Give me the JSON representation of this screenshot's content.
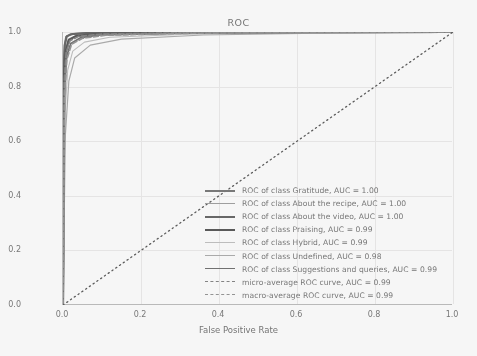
{
  "chart_data": {
    "type": "line",
    "title": "ROC",
    "xlabel": "False Positive Rate",
    "ylabel": "True Positive Rate",
    "xlim": [
      0.0,
      1.0
    ],
    "ylim": [
      0.0,
      1.0
    ],
    "grid": true,
    "legend_position": "lower right",
    "xticks": [
      "0.0",
      "0.2",
      "0.4",
      "0.6",
      "0.8",
      "1.0"
    ],
    "yticks": [
      "0.0",
      "0.2",
      "0.4",
      "0.6",
      "0.8",
      "1.0"
    ],
    "xtick_values": [
      0.0,
      0.2,
      0.4,
      0.6,
      0.8,
      1.0
    ],
    "ytick_values": [
      0.0,
      0.2,
      0.4,
      0.6,
      0.8,
      1.0
    ],
    "reference_line": {
      "name": "chance-diagonal",
      "style": "dotted",
      "color": "#4d4d4d",
      "points": [
        [
          0.0,
          0.0
        ],
        [
          1.0,
          1.0
        ]
      ]
    },
    "series": [
      {
        "name": "ROC of class Gratitude",
        "auc": "1.00",
        "legend": "ROC of class Gratitude, AUC = 1.00",
        "style": "solid",
        "color": "#6e6e6e",
        "width": 2.0,
        "x": [
          0.0,
          0.002,
          0.004,
          0.008,
          0.02,
          0.06,
          0.2,
          0.5,
          1.0
        ],
        "y": [
          0.0,
          0.86,
          0.95,
          0.982,
          0.992,
          0.996,
          0.998,
          0.999,
          1.0
        ]
      },
      {
        "name": "ROC of class About the recipe",
        "auc": "1.00",
        "legend": "ROC of class About the recipe, AUC = 1.00",
        "style": "solid",
        "color": "#9a9a9a",
        "width": 1.3,
        "x": [
          0.0,
          0.003,
          0.006,
          0.012,
          0.03,
          0.08,
          0.25,
          0.6,
          1.0
        ],
        "y": [
          0.0,
          0.8,
          0.92,
          0.966,
          0.984,
          0.992,
          0.996,
          0.999,
          1.0
        ]
      },
      {
        "name": "ROC of class About the video",
        "auc": "1.00",
        "legend": "ROC of class About the video, AUC = 1.00",
        "style": "solid",
        "color": "#5a5a5a",
        "width": 2.0,
        "x": [
          0.0,
          0.002,
          0.005,
          0.01,
          0.025,
          0.07,
          0.22,
          0.55,
          1.0
        ],
        "y": [
          0.0,
          0.88,
          0.955,
          0.985,
          0.993,
          0.997,
          0.999,
          0.999,
          1.0
        ]
      },
      {
        "name": "ROC of class Praising",
        "auc": "0.99",
        "legend": "ROC of class Praising, AUC = 0.99",
        "style": "solid",
        "color": "#4a4a4a",
        "width": 2.2,
        "x": [
          0.0,
          0.003,
          0.007,
          0.015,
          0.035,
          0.09,
          0.28,
          0.62,
          1.0
        ],
        "y": [
          0.0,
          0.84,
          0.93,
          0.972,
          0.986,
          0.993,
          0.997,
          0.999,
          1.0
        ]
      },
      {
        "name": "ROC of class Hybrid",
        "auc": "0.99",
        "legend": "ROC of class Hybrid, AUC = 0.99",
        "style": "solid",
        "color": "#bdbdbd",
        "width": 1.1,
        "x": [
          0.0,
          0.005,
          0.012,
          0.025,
          0.055,
          0.12,
          0.32,
          0.66,
          1.0
        ],
        "y": [
          0.0,
          0.7,
          0.86,
          0.93,
          0.963,
          0.981,
          0.992,
          0.998,
          1.0
        ]
      },
      {
        "name": "ROC of class Undefined",
        "auc": "0.98",
        "legend": "ROC of class Undefined, AUC = 0.98",
        "style": "solid",
        "color": "#a8a8a8",
        "width": 1.2,
        "x": [
          0.0,
          0.006,
          0.015,
          0.03,
          0.07,
          0.15,
          0.36,
          0.7,
          1.0
        ],
        "y": [
          0.0,
          0.62,
          0.82,
          0.905,
          0.952,
          0.974,
          0.989,
          0.997,
          1.0
        ]
      },
      {
        "name": "ROC of class Suggestions and queries",
        "auc": "0.99",
        "legend": "ROC of class Suggestions and queries, AUC = 0.99",
        "style": "solid",
        "color": "#666666",
        "width": 1.8,
        "x": [
          0.0,
          0.004,
          0.009,
          0.02,
          0.045,
          0.1,
          0.3,
          0.64,
          1.0
        ],
        "y": [
          0.0,
          0.78,
          0.91,
          0.958,
          0.979,
          0.99,
          0.996,
          0.999,
          1.0
        ]
      },
      {
        "name": "micro-average ROC curve",
        "auc": "0.99",
        "legend": "micro-average ROC curve, AUC = 0.99",
        "style": "dashed",
        "color": "#7b7b7b",
        "width": 1.6,
        "x": [
          0.0,
          0.003,
          0.008,
          0.018,
          0.04,
          0.095,
          0.29,
          0.63,
          1.0
        ],
        "y": [
          0.0,
          0.82,
          0.925,
          0.968,
          0.984,
          0.992,
          0.997,
          0.999,
          1.0
        ]
      },
      {
        "name": "macro-average ROC curve",
        "auc": "0.99",
        "legend": "macro-average ROC curve, AUC = 0.99",
        "style": "dashed",
        "color": "#8d8d8d",
        "width": 1.6,
        "x": [
          0.0,
          0.004,
          0.01,
          0.022,
          0.05,
          0.11,
          0.31,
          0.65,
          1.0
        ],
        "y": [
          0.0,
          0.77,
          0.9,
          0.955,
          0.977,
          0.988,
          0.995,
          0.999,
          1.0
        ]
      }
    ]
  }
}
